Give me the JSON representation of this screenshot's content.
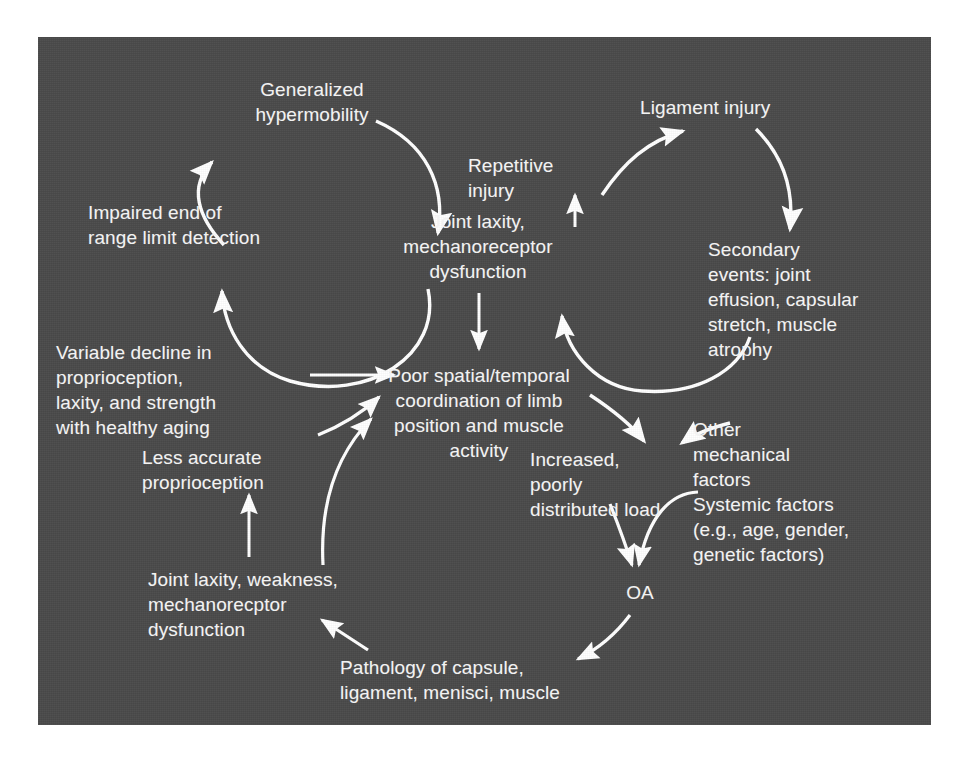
{
  "figure": {
    "panel_background_color": "#4a4a4a",
    "text_color": "#f2f2f2",
    "arrow_color": "#ffffff",
    "page_background_color": "#ffffff"
  },
  "nodes": {
    "generalized_hypermobility": "Generalized\nhypermobility",
    "impaired_end_range": "Impaired end of\nrange limit detection",
    "variable_decline": "Variable decline in\nproprioception,\nlaxity, and strength\nwith healthy aging",
    "less_accurate_proprioception": "Less accurate\nproprioception",
    "joint_laxity_weakness": "Joint laxity, weakness,\nmechanorecptor\ndysfunction",
    "pathology_of_capsule": "Pathology of capsule,\nligament, menisci, muscle",
    "joint_laxity_mechanoreceptor": "Joint laxity,\nmechanoreceptor\ndysfunction",
    "poor_coordination": "Poor spatial/temporal\ncoordination of limb\nposition and muscle\nactivity",
    "repetitive_injury": "Repetitive\ninjury",
    "ligament_injury": "Ligament injury",
    "secondary_events": "Secondary\nevents: joint\neffusion, capsular\nstretch, muscle\natrophy",
    "increased_load": "Increased,\npoorly\ndistributed load",
    "other_mechanical_factors": "Other\nmechanical\nfactors",
    "systemic_factors": "Systemic factors\n(e.g., age, gender,\ngenetic factors)",
    "oa": "OA"
  },
  "edges": [
    {
      "id": "edge-hypermobility-to-joint-laxity",
      "from": "generalized_hypermobility",
      "to": "joint_laxity_mechanoreceptor",
      "style": "curved-arc"
    },
    {
      "id": "edge-impaired-to-hypermobility",
      "from": "impaired_end_range",
      "to": "generalized_hypermobility",
      "style": "curved-arc"
    },
    {
      "id": "edge-joint-laxity-to-impaired",
      "from": "joint_laxity_mechanoreceptor",
      "to": "impaired_end_range",
      "style": "curved-arc"
    },
    {
      "id": "edge-variable-decline-to-poor-coordination",
      "from": "variable_decline",
      "to": "poor_coordination",
      "style": "straight"
    },
    {
      "id": "edge-less-accurate-to-poor-coordination",
      "from": "less_accurate_proprioception",
      "to": "poor_coordination",
      "style": "curved-arc"
    },
    {
      "id": "edge-joint-laxity-weakness-to-less-accurate",
      "from": "joint_laxity_weakness",
      "to": "less_accurate_proprioception",
      "style": "straight"
    },
    {
      "id": "edge-joint-laxity-weakness-to-poor-coordination",
      "from": "joint_laxity_weakness",
      "to": "poor_coordination",
      "style": "curved-arc"
    },
    {
      "id": "edge-pathology-to-joint-laxity-weakness",
      "from": "pathology_of_capsule",
      "to": "joint_laxity_weakness",
      "style": "straight"
    },
    {
      "id": "edge-joint-laxity-to-poor-coordination",
      "from": "joint_laxity_mechanoreceptor",
      "to": "poor_coordination",
      "style": "straight"
    },
    {
      "id": "edge-joint-laxity-to-repetitive-injury",
      "from": "joint_laxity_mechanoreceptor",
      "to": "repetitive_injury",
      "style": "straight"
    },
    {
      "id": "edge-repetitive-injury-to-ligament-injury",
      "from": "repetitive_injury",
      "to": "ligament_injury",
      "style": "curved-arc"
    },
    {
      "id": "edge-ligament-injury-to-secondary-events",
      "from": "ligament_injury",
      "to": "secondary_events",
      "style": "curved-arc"
    },
    {
      "id": "edge-secondary-events-to-joint-laxity",
      "from": "secondary_events",
      "to": "joint_laxity_mechanoreceptor",
      "style": "curved-arc"
    },
    {
      "id": "edge-poor-coordination-to-increased-load",
      "from": "poor_coordination",
      "to": "increased_load",
      "style": "curved-arc"
    },
    {
      "id": "edge-other-mechanical-to-increased-load",
      "from": "other_mechanical_factors",
      "to": "increased_load",
      "style": "curved-arc"
    },
    {
      "id": "edge-increased-load-to-oa",
      "from": "increased_load",
      "to": "oa",
      "style": "curved-arc"
    },
    {
      "id": "edge-systemic-factors-to-oa",
      "from": "systemic_factors",
      "to": "oa",
      "style": "curved-arc"
    },
    {
      "id": "edge-oa-to-pathology",
      "from": "oa",
      "to": "pathology_of_capsule",
      "style": "curved-arc"
    }
  ]
}
